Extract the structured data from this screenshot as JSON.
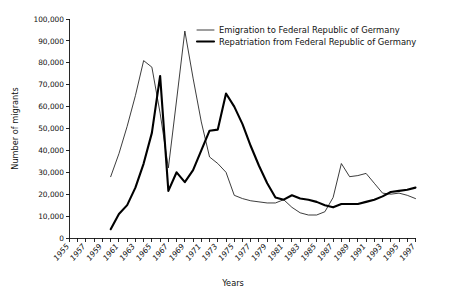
{
  "chart_data": {
    "type": "line",
    "title": "",
    "xlabel": "Years",
    "ylabel": "Number of migrants",
    "xlim": [
      1955,
      1997
    ],
    "ylim": [
      0,
      100000
    ],
    "grid": false,
    "legend_position": "top-right",
    "y_ticks": [
      0,
      10000,
      20000,
      30000,
      40000,
      50000,
      60000,
      70000,
      80000,
      90000,
      100000
    ],
    "y_tick_labels": [
      "0",
      "10,000",
      "20,000",
      "30,000",
      "40,000",
      "50,000",
      "60,000",
      "70,000",
      "80,000",
      "90,000",
      "100,000"
    ],
    "x_ticks_all": [
      1955,
      1956,
      1957,
      1958,
      1959,
      1960,
      1961,
      1962,
      1963,
      1964,
      1965,
      1966,
      1967,
      1968,
      1969,
      1970,
      1971,
      1972,
      1973,
      1974,
      1975,
      1976,
      1977,
      1978,
      1979,
      1980,
      1981,
      1982,
      1983,
      1984,
      1985,
      1986,
      1987,
      1988,
      1989,
      1990,
      1991,
      1992,
      1993,
      1994,
      1995,
      1996,
      1997
    ],
    "x_tick_labels": [
      "1955",
      "1957",
      "1959",
      "1961",
      "1963",
      "1965",
      "1967",
      "1969",
      "1971",
      "1973",
      "1975",
      "1977",
      "1979",
      "1981",
      "1983",
      "1985",
      "1987",
      "1989",
      "1991",
      "1993",
      "1995",
      "1997"
    ],
    "x_tick_labeled_years": [
      1955,
      1957,
      1959,
      1961,
      1963,
      1965,
      1967,
      1969,
      1971,
      1973,
      1975,
      1977,
      1979,
      1981,
      1983,
      1985,
      1987,
      1989,
      1991,
      1993,
      1995,
      1997
    ],
    "series": [
      {
        "name": "Emigration to Federal Republic of Germany",
        "style": "thin",
        "color": "#1a1a1a",
        "x": [
          1960,
          1961,
          1962,
          1963,
          1964,
          1965,
          1966,
          1967,
          1968,
          1969,
          1970,
          1971,
          1972,
          1973,
          1974,
          1975,
          1976,
          1977,
          1978,
          1979,
          1980,
          1981,
          1982,
          1983,
          1984,
          1985,
          1986,
          1987,
          1988,
          1989,
          1990,
          1991,
          1992,
          1993,
          1994,
          1995,
          1996,
          1997
        ],
        "values": [
          28000,
          38500,
          51000,
          65000,
          81000,
          78000,
          57000,
          32000,
          63000,
          94500,
          73000,
          53000,
          37000,
          34000,
          30000,
          19500,
          18000,
          17000,
          16500,
          16000,
          16000,
          17500,
          14000,
          11500,
          10500,
          10500,
          12000,
          18500,
          34000,
          28000,
          28500,
          29500,
          25000,
          20500,
          20000,
          20500,
          19500,
          18000
        ]
      },
      {
        "name": "Repatriation from Federal Republic of Germany",
        "style": "thick",
        "color": "#000000",
        "x": [
          1960,
          1961,
          1962,
          1963,
          1964,
          1965,
          1966,
          1967,
          1968,
          1969,
          1970,
          1971,
          1972,
          1973,
          1974,
          1975,
          1976,
          1977,
          1978,
          1979,
          1980,
          1981,
          1982,
          1983,
          1984,
          1985,
          1986,
          1987,
          1988,
          1989,
          1990,
          1991,
          1992,
          1993,
          1994,
          1995,
          1996,
          1997
        ],
        "values": [
          4000,
          11000,
          15000,
          23000,
          34000,
          48000,
          74000,
          21500,
          30000,
          25500,
          31000,
          40000,
          49000,
          49500,
          66000,
          60000,
          52000,
          42000,
          33000,
          25000,
          18500,
          17500,
          19500,
          18000,
          17500,
          16500,
          15000,
          14000,
          15500,
          15500,
          15500,
          16500,
          17500,
          19000,
          21000,
          21500,
          22000,
          23000
        ]
      }
    ]
  },
  "legend": {
    "entries": [
      {
        "label": "Emigration to Federal Republic of Germany",
        "style": "thin"
      },
      {
        "label": "Repatriation from Federal Republic of Germany",
        "style": "thick"
      }
    ]
  },
  "axes": {
    "y_title": "Number of migrants",
    "x_title": "Years"
  }
}
